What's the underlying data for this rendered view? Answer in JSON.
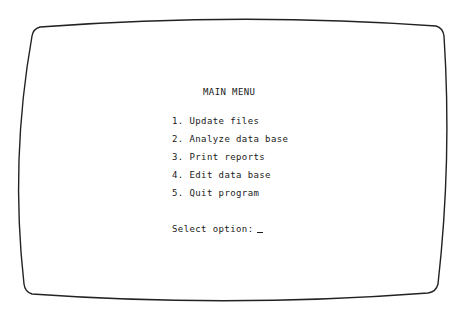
{
  "screen": {
    "title": "MAIN MENU",
    "menu_items": [
      {
        "number": "1.",
        "label": "Update files"
      },
      {
        "number": "2.",
        "label": "Analyze data base"
      },
      {
        "number": "3.",
        "label": "Print reports"
      },
      {
        "number": "4.",
        "label": "Edit data base"
      },
      {
        "number": "5.",
        "label": "Quit program"
      }
    ],
    "prompt": "Select option:",
    "input_value": ""
  },
  "colors": {
    "background": "#ffffff",
    "text": "#1a1a1a",
    "bezel": "#222222"
  }
}
